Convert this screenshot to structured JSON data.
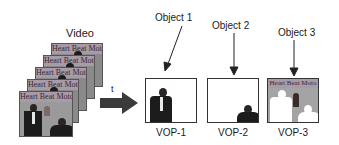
{
  "diagram": {
    "video_label": "Video",
    "time_label": "t",
    "frame_banner_text": "Heart Beat Moto",
    "frame_count": 5,
    "objects": [
      {
        "label": "Object 1",
        "vop_label": "VOP-1",
        "content": "standing man in dark suit on white background"
      },
      {
        "label": "Object 2",
        "vop_label": "VOP-2",
        "content": "seated man in lower right on white background"
      },
      {
        "label": "Object 3",
        "vop_label": "VOP-3",
        "content": "background scene with white silhouettes of removed objects"
      }
    ],
    "colors": {
      "arrow": "#3a3a3a",
      "frame_bg": "#8a8a8a",
      "banner": "#a89aa6",
      "outline": "#333333"
    }
  }
}
